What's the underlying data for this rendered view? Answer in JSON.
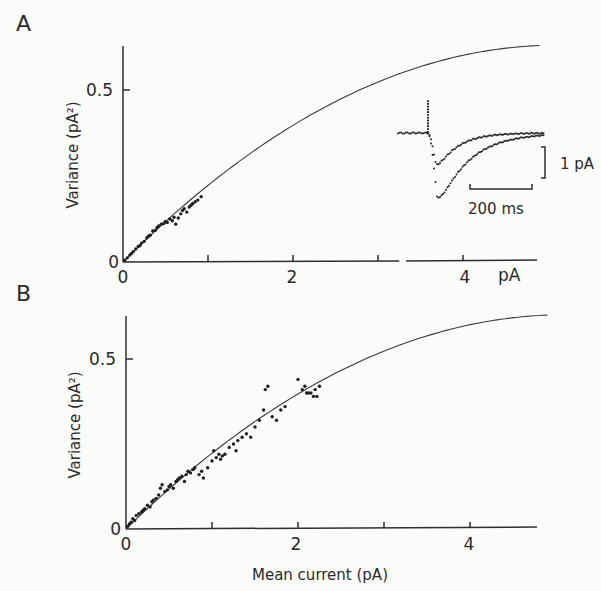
{
  "figure": {
    "panels": [
      {
        "id": "A",
        "label": "A",
        "ylabel": "Variance (pA²)",
        "y_ticks": [
          "0",
          "0.5"
        ],
        "x_ticks": [
          "0",
          "2",
          "4"
        ],
        "x_unit_label": "pA",
        "inset": {
          "vertical_scale_label": "1 pA",
          "time_scale_label": "200 ms"
        }
      },
      {
        "id": "B",
        "label": "B",
        "ylabel": "Variance (pA²)",
        "y_ticks": [
          "0",
          "0.5"
        ],
        "x_ticks": [
          "0",
          "2",
          "4"
        ],
        "xlabel": "Mean current (pA)"
      }
    ]
  },
  "chart_data": [
    {
      "type": "scatter",
      "title": "A",
      "xlabel": "pA",
      "ylabel": "Variance (pA²)",
      "xlim": [
        0,
        4.9
      ],
      "ylim": [
        0,
        0.63
      ],
      "x_ticks": [
        0,
        1,
        2,
        3,
        4
      ],
      "x_tick_labels": [
        "0",
        "",
        "2",
        "",
        "4"
      ],
      "y_ticks": [
        0,
        0.5
      ],
      "grid": false,
      "axis_break_x": [
        3.25,
        3.33
      ],
      "fit_curve": {
        "form": "variance = i*I - I^2/N",
        "i": 0.247,
        "inv_N": 0.0242,
        "x_range": [
          0,
          4.9
        ]
      },
      "series": [
        {
          "name": "data",
          "x": [
            0.02,
            0.05,
            0.08,
            0.1,
            0.12,
            0.15,
            0.18,
            0.2,
            0.22,
            0.25,
            0.28,
            0.3,
            0.32,
            0.35,
            0.38,
            0.4,
            0.42,
            0.45,
            0.48,
            0.5,
            0.52,
            0.55,
            0.58,
            0.6,
            0.62,
            0.65,
            0.68,
            0.7,
            0.72,
            0.75,
            0.78,
            0.8,
            0.82,
            0.85,
            0.88,
            0.92
          ],
          "y": [
            0.005,
            0.012,
            0.02,
            0.025,
            0.03,
            0.038,
            0.045,
            0.048,
            0.055,
            0.06,
            0.07,
            0.075,
            0.078,
            0.09,
            0.092,
            0.1,
            0.105,
            0.11,
            0.112,
            0.118,
            0.115,
            0.125,
            0.12,
            0.13,
            0.11,
            0.128,
            0.14,
            0.15,
            0.155,
            0.145,
            0.16,
            0.165,
            0.17,
            0.175,
            0.18,
            0.19
          ]
        }
      ],
      "inset": {
        "type": "line",
        "description": "two averaged current traces (dotted), stimulus artifact then inward transient returning to baseline",
        "scale_bars": {
          "current": "1 pA",
          "time": "200 ms"
        },
        "traces": [
          {
            "name": "small",
            "peak_pA": -1.2
          },
          {
            "name": "large",
            "peak_pA": -2.4
          }
        ]
      }
    },
    {
      "type": "scatter",
      "title": "B",
      "xlabel": "Mean current (pA)",
      "ylabel": "Variance (pA²)",
      "xlim": [
        0,
        4.9
      ],
      "ylim": [
        0,
        0.63
      ],
      "x_ticks": [
        0,
        1,
        2,
        3,
        4
      ],
      "x_tick_labels": [
        "0",
        "",
        "2",
        "",
        "4"
      ],
      "y_ticks": [
        0,
        0.5
      ],
      "grid": false,
      "fit_curve": {
        "form": "variance = i*I - I^2/N",
        "i": 0.247,
        "inv_N": 0.0242,
        "x_range": [
          0,
          4.9
        ]
      },
      "series": [
        {
          "name": "data",
          "x": [
            0.02,
            0.04,
            0.06,
            0.08,
            0.1,
            0.12,
            0.15,
            0.18,
            0.2,
            0.22,
            0.25,
            0.28,
            0.3,
            0.32,
            0.35,
            0.38,
            0.4,
            0.42,
            0.45,
            0.48,
            0.5,
            0.52,
            0.55,
            0.58,
            0.6,
            0.62,
            0.65,
            0.68,
            0.7,
            0.72,
            0.75,
            0.78,
            0.8,
            0.85,
            0.88,
            0.9,
            0.95,
            1.0,
            1.02,
            1.05,
            1.08,
            1.1,
            1.12,
            1.15,
            1.2,
            1.25,
            1.28,
            1.3,
            1.35,
            1.4,
            1.45,
            1.5,
            1.55,
            1.6,
            1.62,
            1.65,
            1.7,
            1.75,
            1.8,
            1.85,
            2.0,
            2.05,
            2.08,
            2.1,
            2.12,
            2.15,
            2.18,
            2.2,
            2.22,
            2.25
          ],
          "y": [
            0.008,
            0.015,
            0.02,
            0.03,
            0.025,
            0.04,
            0.045,
            0.05,
            0.055,
            0.06,
            0.07,
            0.065,
            0.08,
            0.085,
            0.09,
            0.1,
            0.12,
            0.13,
            0.11,
            0.115,
            0.125,
            0.13,
            0.12,
            0.14,
            0.145,
            0.15,
            0.155,
            0.14,
            0.16,
            0.17,
            0.165,
            0.175,
            0.18,
            0.16,
            0.17,
            0.15,
            0.18,
            0.2,
            0.23,
            0.21,
            0.22,
            0.205,
            0.215,
            0.22,
            0.24,
            0.25,
            0.23,
            0.26,
            0.27,
            0.28,
            0.27,
            0.3,
            0.32,
            0.35,
            0.41,
            0.42,
            0.33,
            0.32,
            0.35,
            0.36,
            0.44,
            0.41,
            0.42,
            0.4,
            0.4,
            0.4,
            0.39,
            0.41,
            0.39,
            0.42
          ]
        }
      ]
    }
  ]
}
